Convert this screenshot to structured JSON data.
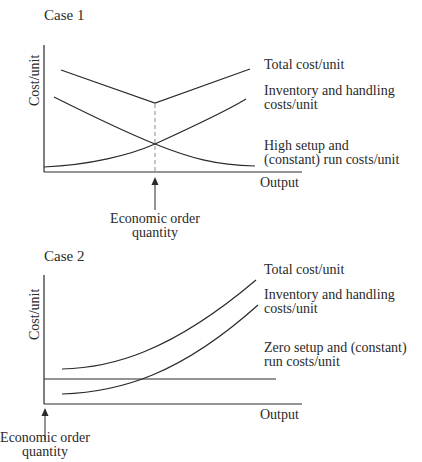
{
  "case1": {
    "title": "Case 1",
    "y_axis_label": "Cost/unit",
    "x_axis_label": "Output",
    "curve_labels": {
      "total": "Total cost/unit",
      "inventory_line1": "Inventory and handling",
      "inventory_line2": "costs/unit",
      "setup_line1": "High setup and",
      "setup_line2": "(constant) run costs/unit"
    },
    "annotation": {
      "line1": "Economic order",
      "line2": "quantity"
    }
  },
  "case2": {
    "title": "Case 2",
    "y_axis_label": "Cost/unit",
    "x_axis_label": "Output",
    "curve_labels": {
      "total": "Total cost/unit",
      "inventory_line1": "Inventory and handling",
      "inventory_line2": "costs/unit",
      "setup_line1": "Zero setup and (constant)",
      "setup_line2": "run costs/unit"
    },
    "annotation": {
      "line1": "Economic order",
      "line2": "quantity"
    }
  },
  "colors": {
    "line": "#2a2a2a",
    "dashed": "#8a8a8a",
    "background": "#ffffff"
  }
}
